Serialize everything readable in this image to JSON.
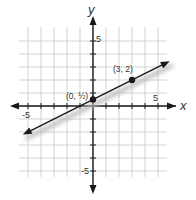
{
  "chart_data": {
    "type": "line",
    "title": "",
    "xlabel": "x",
    "ylabel": "y",
    "xlim": [
      -5.5,
      5.5
    ],
    "ylim": [
      -5.5,
      5.5
    ],
    "grid": true,
    "x_ticks_labeled": [
      -5,
      5
    ],
    "y_ticks_labeled": [
      5,
      -5
    ],
    "tick_labels": {
      "x_neg": "-5",
      "x_pos": "5",
      "y_pos": "5",
      "y_neg": "-5"
    },
    "line": {
      "slope": 0.5,
      "intercept": 0.5,
      "x_from": -5.4,
      "x_to": 5.9
    },
    "series": [
      {
        "name": "line",
        "x": [
          0,
          3
        ],
        "y": [
          0.5,
          2
        ]
      }
    ],
    "points": [
      {
        "x": 0,
        "y": 0.5,
        "label": "(0, ½)"
      },
      {
        "x": 3,
        "y": 2,
        "label": "(3, 2)"
      }
    ],
    "colors": {
      "grid": "#c8c8c8",
      "axis": "#1a1a1a",
      "line": "#1a1a1a",
      "shadow": "#bbbbbb"
    }
  }
}
